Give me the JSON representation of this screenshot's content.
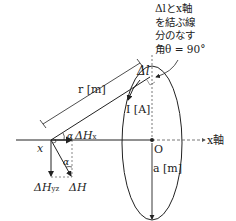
{
  "annotation": {
    "lines": [
      "Δlとx軸",
      "を結ぶ線",
      "分のなす",
      "角θ = 90°"
    ]
  },
  "labels": {
    "delta_l": "Δl",
    "r": "r [m]",
    "current": "I [A]",
    "alpha_top": "α",
    "delta_hx": "ΔH",
    "delta_hx_sub": "x",
    "point_x": "x",
    "alpha_bottom": "α",
    "delta_hyz": "ΔH",
    "delta_hyz_sub": "yz",
    "delta_h": "ΔH",
    "origin": "O",
    "x_axis": "x軸",
    "radius": "a [m]"
  },
  "colors": {
    "line": "#222222",
    "dashed": "#555555",
    "background": "#ffffff"
  }
}
